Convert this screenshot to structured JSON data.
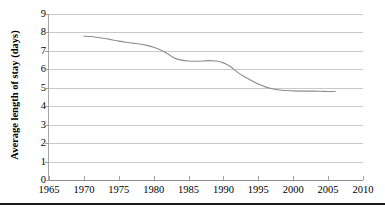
{
  "chart_data": {
    "type": "line",
    "title": "",
    "xlabel": "",
    "ylabel": "Average length of stay (days)",
    "xlim": [
      1965,
      2010
    ],
    "ylim": [
      0,
      9
    ],
    "grid": true,
    "legend": false,
    "legend_position": "none",
    "xticks": [
      1965,
      1970,
      1975,
      1980,
      1985,
      1990,
      1995,
      2000,
      2005,
      2010
    ],
    "yticks": [
      0,
      1,
      2,
      3,
      4,
      5,
      6,
      7,
      8,
      9
    ],
    "line_color": "#8c8c8c",
    "gridline_color": "#c9c9c9",
    "background_color": "#ffffff",
    "series": [
      {
        "name": "Average length of stay",
        "x": [
          1970,
          1971,
          1972,
          1973,
          1974,
          1975,
          1976,
          1977,
          1978,
          1979,
          1980,
          1981,
          1982,
          1983,
          1984,
          1985,
          1986,
          1987,
          1988,
          1989,
          1990,
          1991,
          1992,
          1993,
          1994,
          1995,
          1996,
          1997,
          1998,
          1999,
          2000,
          2001,
          2002,
          2003,
          2004,
          2005,
          2006
        ],
        "values": [
          7.8,
          7.78,
          7.73,
          7.67,
          7.6,
          7.53,
          7.47,
          7.42,
          7.37,
          7.3,
          7.2,
          7.05,
          6.85,
          6.6,
          6.5,
          6.45,
          6.44,
          6.45,
          6.47,
          6.45,
          6.35,
          6.15,
          5.85,
          5.6,
          5.4,
          5.2,
          5.05,
          4.95,
          4.88,
          4.85,
          4.83,
          4.82,
          4.82,
          4.82,
          4.81,
          4.8,
          4.8
        ]
      }
    ]
  },
  "axes": {
    "y_title": "Average length of stay (days)",
    "y_tick_labels": [
      "9",
      "8",
      "7",
      "6",
      "5",
      "4",
      "3",
      "2",
      "1",
      "0"
    ],
    "x_tick_labels": [
      "1965",
      "1970",
      "1975",
      "1980",
      "1985",
      "1990",
      "1995",
      "2000",
      "2005",
      "2010"
    ]
  }
}
